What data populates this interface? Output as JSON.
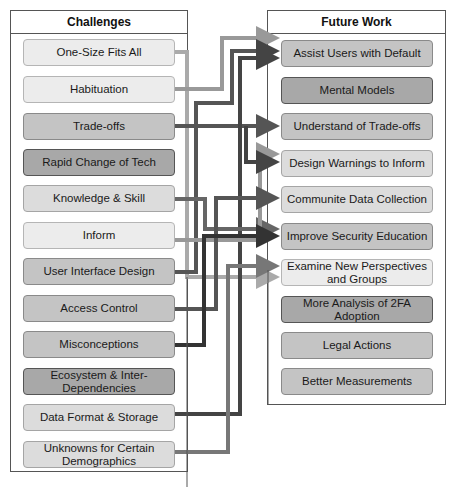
{
  "challenges": {
    "title": "Challenges",
    "items": [
      {
        "label": "One-Size Fits All",
        "tone": "t1"
      },
      {
        "label": "Habituation",
        "tone": "t1"
      },
      {
        "label": "Trade-offs",
        "tone": "t3"
      },
      {
        "label": "Rapid Change of Tech",
        "tone": "t4"
      },
      {
        "label": "Knowledge & Skill",
        "tone": "t2"
      },
      {
        "label": "Inform",
        "tone": "t1"
      },
      {
        "label": "User Interface Design",
        "tone": "t3"
      },
      {
        "label": "Access Control",
        "tone": "t3"
      },
      {
        "label": "Misconceptions",
        "tone": "t3"
      },
      {
        "label": "Ecosystem & Inter-Dependencies",
        "tone": "t4"
      },
      {
        "label": "Data Format & Storage",
        "tone": "t2"
      },
      {
        "label": "Unknowns for Certain Demographics",
        "tone": "t2"
      }
    ]
  },
  "future_work": {
    "title": "Future Work",
    "items": [
      {
        "label": "Assist Users with Default",
        "tone": "t3"
      },
      {
        "label": "Mental Models",
        "tone": "t4"
      },
      {
        "label": "Understand of Trade-offs",
        "tone": "t3"
      },
      {
        "label": "Design Warnings to Inform",
        "tone": "t2"
      },
      {
        "label": "Communite Data Collection",
        "tone": "t2"
      },
      {
        "label": "Improve Security Education",
        "tone": "t3"
      },
      {
        "label": "Examine New Perspectives and Groups",
        "tone": "t1"
      },
      {
        "label": "More Analysis of 2FA Adoption",
        "tone": "t4"
      },
      {
        "label": "Legal Actions",
        "tone": "t3"
      },
      {
        "label": "Better Measurements",
        "tone": "t3"
      }
    ]
  },
  "connections": [
    {
      "from": "One-Size Fits All",
      "to": "Examine New Perspectives and Groups",
      "color": "#aaaaaa"
    },
    {
      "from": "Habituation",
      "to": "Assist Users with Default",
      "color": "#999999"
    },
    {
      "from": "Trade-offs",
      "to": "Understand of Trade-offs",
      "color": "#555555"
    },
    {
      "from": "Knowledge & Skill",
      "to": "Improve Security Education",
      "color": "#666666"
    },
    {
      "from": "Inform",
      "to": "Design Warnings to Inform",
      "color": "#999999"
    },
    {
      "from": "User Interface Design",
      "to": "Assist Users with Default",
      "color": "#444444"
    },
    {
      "from": "Access Control",
      "to": "Communite Data Collection",
      "color": "#555555"
    },
    {
      "from": "Misconceptions",
      "to": "Improve Security Education",
      "color": "#333333"
    },
    {
      "from": "Data Format & Storage",
      "to": "Assist Users with Default",
      "color": "#444444"
    },
    {
      "from": "Unknowns for Certain Demographics",
      "to": "Examine New Perspectives and Groups",
      "color": "#777777"
    }
  ]
}
